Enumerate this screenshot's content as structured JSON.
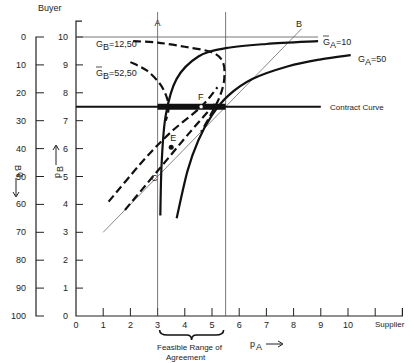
{
  "chart_data": {
    "type": "line",
    "title": "",
    "top_label": "Buyer",
    "right_label": "Supplier",
    "xlabel": "p_A",
    "ylabel_inner": "p_B",
    "ylabel_outer": "q_B",
    "xlim": [
      0,
      12
    ],
    "ylim": [
      0,
      10.5
    ],
    "x_ticks": [
      0,
      1,
      2,
      3,
      4,
      5,
      6,
      7,
      8,
      9,
      10,
      11
    ],
    "x_tick_labels": [
      "0",
      "1",
      "2",
      "3",
      "4",
      "5",
      "6",
      "7",
      "8",
      "9",
      "10",
      ""
    ],
    "y_inner_ticks": [
      0,
      1,
      2,
      3,
      4,
      5,
      6,
      7,
      8,
      9,
      10
    ],
    "y_inner_tick_labels": [
      "0",
      "1",
      "2",
      "3",
      "4",
      "5",
      "6",
      "7",
      "8",
      "9",
      "10"
    ],
    "y_outer_ticks": [
      0,
      10,
      20,
      30,
      40,
      50,
      60,
      70,
      80,
      90,
      100
    ],
    "y_outer_tick_labels": [
      "0",
      "10",
      "20",
      "30",
      "40",
      "50",
      "60",
      "70",
      "80",
      "90",
      "100"
    ],
    "reference_lines": {
      "vertical_A": 3,
      "vertical_right": 5.5,
      "horizontal_top": 10,
      "diagonal": [
        [
          1,
          3
        ],
        [
          8.3,
          10.3
        ]
      ]
    },
    "contract_curve": {
      "label": "Contract Curve",
      "p_B": 7.5,
      "x_range": [
        0,
        9
      ],
      "feasible_range": [
        3,
        5.5
      ]
    },
    "series": [
      {
        "name": "G_B=12,50",
        "label": "G_B = 12,50",
        "style": "dashed",
        "points": [
          [
            2.1,
            9.85
          ],
          [
            3,
            9.8
          ],
          [
            4,
            9.65
          ],
          [
            5,
            9.45
          ],
          [
            5.4,
            9.1
          ],
          [
            5.45,
            8.5
          ],
          [
            5.3,
            7.9
          ],
          [
            5,
            7.3
          ],
          [
            4.6,
            6.6
          ]
        ]
      },
      {
        "name": "G_B=52,50",
        "label": "Ḡ_B = 52,50",
        "style": "dashed",
        "points": [
          [
            2.0,
            9.1
          ],
          [
            2.6,
            8.8
          ],
          [
            3.1,
            8.3
          ],
          [
            3.35,
            7.8
          ],
          [
            3.4,
            7.4
          ],
          [
            3.3,
            7.0
          ]
        ]
      },
      {
        "name": "G_A=10",
        "label": "Ḡ_A = 10",
        "style": "solid",
        "points": [
          [
            3.1,
            3.6
          ],
          [
            3.15,
            5.5
          ],
          [
            3.3,
            7.2
          ],
          [
            3.7,
            8.5
          ],
          [
            4.5,
            9.3
          ],
          [
            5.5,
            9.6
          ],
          [
            7,
            9.75
          ],
          [
            8.9,
            9.85
          ]
        ]
      },
      {
        "name": "G_A=50",
        "label": "G_A = 50",
        "style": "solid",
        "points": [
          [
            3.7,
            3.5
          ],
          [
            4.1,
            5.2
          ],
          [
            4.5,
            6.3
          ],
          [
            5.0,
            7.2
          ],
          [
            5.6,
            7.9
          ],
          [
            6.5,
            8.5
          ],
          [
            7.8,
            8.95
          ],
          [
            9,
            9.2
          ],
          [
            10.1,
            9.35
          ]
        ]
      },
      {
        "name": "dashed-lower-1",
        "label": "",
        "style": "dashed",
        "points": [
          [
            1.2,
            4.1
          ],
          [
            2.5,
            5.6
          ],
          [
            3.5,
            6.6
          ],
          [
            4.6,
            7.5
          ],
          [
            5.2,
            8.2
          ]
        ]
      },
      {
        "name": "dashed-lower-2",
        "label": "",
        "style": "dashed",
        "points": [
          [
            1.8,
            3.8
          ],
          [
            3,
            5.2
          ],
          [
            4.2,
            6.6
          ],
          [
            5.1,
            7.6
          ]
        ]
      }
    ],
    "points": [
      {
        "label": "A",
        "x": 3,
        "y": 10.4
      },
      {
        "label": "B",
        "x": 8.2,
        "y": 10.35
      },
      {
        "label": "C",
        "x": 3.1,
        "y": 5.0
      },
      {
        "label": "E",
        "x": 3.5,
        "y": 6.05
      },
      {
        "label": "F",
        "x": 4.6,
        "y": 7.5
      }
    ],
    "annotation": "Feasible Range of Agreement",
    "annotation_lines": [
      "Feasible Range of",
      "Agreement"
    ]
  }
}
